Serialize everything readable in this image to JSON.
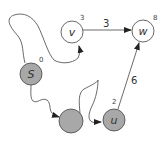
{
  "diagram": {
    "type": "graph",
    "colors": {
      "visited_fill": "#a8a8a8",
      "unvisited_fill": "#ffffff",
      "stroke": "#444444"
    },
    "nodes": [
      {
        "id": "v",
        "label": "v",
        "distance": "3",
        "visited": false
      },
      {
        "id": "w",
        "label": "w",
        "distance": "8",
        "visited": false
      },
      {
        "id": "S",
        "label": "S",
        "distance": "0",
        "visited": true
      },
      {
        "id": "x",
        "label": "",
        "distance": "",
        "visited": true
      },
      {
        "id": "u",
        "label": "u",
        "distance": "2",
        "visited": true
      }
    ],
    "edges": [
      {
        "from": "v",
        "to": "w",
        "weight": "3",
        "style": "straight"
      },
      {
        "from": "u",
        "to": "w",
        "weight": "6",
        "style": "straight"
      },
      {
        "from": "S",
        "to": "v",
        "weight": "",
        "style": "path"
      },
      {
        "from": "S",
        "to": "x",
        "weight": "",
        "style": "path"
      },
      {
        "from": "x",
        "to": "u",
        "weight": "",
        "style": "path"
      }
    ]
  }
}
